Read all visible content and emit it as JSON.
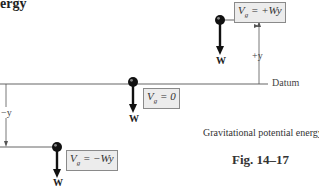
{
  "title_fragment": "ergy",
  "datum_label": "Datum",
  "positions": [
    {
      "id": "above",
      "potential_symbol": "V",
      "potential_sub": "g",
      "potential_value": " = +Wy",
      "weight_label": "W",
      "offset_label": "+y"
    },
    {
      "id": "datum",
      "potential_symbol": "V",
      "potential_sub": "g",
      "potential_value": " = 0",
      "weight_label": "W"
    },
    {
      "id": "below",
      "potential_symbol": "V",
      "potential_sub": "g",
      "potential_value": " = −Wy",
      "weight_label": "W",
      "offset_label": "−y"
    }
  ],
  "caption": "Gravitational potential energy",
  "figure_number": "Fig. 14–17",
  "colors": {
    "line": "#555555",
    "box_bg": "#ececec",
    "box_border": "#8a8a8a",
    "ball": "#111111"
  }
}
